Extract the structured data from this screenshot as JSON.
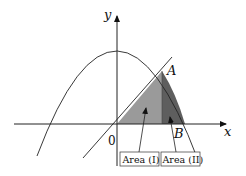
{
  "diagram": {
    "axes": {
      "x_label": "x",
      "y_label": "y",
      "origin_label": "0"
    },
    "points": {
      "A": "A",
      "B": "B"
    },
    "regions": [
      {
        "id": "area1",
        "label": "Area (I)",
        "fill": "#9a9a9a"
      },
      {
        "id": "area2",
        "label": "Area (II)",
        "fill": "#5e5e5e"
      }
    ],
    "curves": [
      {
        "name": "parabola",
        "description": "downward-opening parabola with vertex on y-axis"
      },
      {
        "name": "line",
        "description": "straight line through origin intersecting parabola at A"
      }
    ],
    "colors": {
      "stroke": "#222222",
      "area1": "#9a9a9a",
      "area2": "#5e5e5e"
    }
  }
}
